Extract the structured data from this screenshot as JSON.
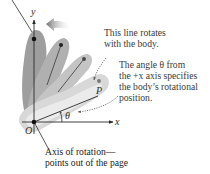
{
  "figure": {
    "axes": {
      "y_label": "y",
      "x_label": "x",
      "origin_label": "O",
      "point_label": "P",
      "angle_label": "θ"
    },
    "annotations": {
      "rotating_line": {
        "line1": "This line rotates",
        "line2": "with the body."
      },
      "angle": {
        "line1": "The angle θ from",
        "line2": "the +x axis specifies",
        "line3": "the body’s rotational",
        "line4": "position."
      },
      "axis_of_rotation": {
        "line1": "Axis of rotation—",
        "line2": "points out of the page"
      }
    },
    "colors": {
      "body_dark": "#9a9a9a",
      "body_mid": "#b5b5b5",
      "body_light": "#d2d2d2",
      "body_lightest": "#e6e6e6",
      "line": "#2a2a2a",
      "dot": "#111111",
      "text": "#3a3a3a",
      "arrow": "#8a8a8a"
    }
  }
}
